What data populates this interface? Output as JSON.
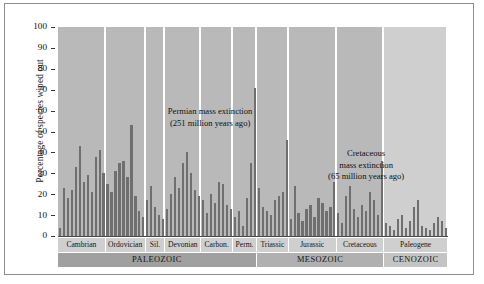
{
  "chart_data": {
    "type": "bar",
    "title": "",
    "xlabel": "",
    "ylabel": "Percentage of species wiped out",
    "ylim": [
      0,
      100
    ],
    "ytick_labels": [
      "100",
      "90",
      "80",
      "70",
      "60",
      "50",
      "40",
      "30",
      "20",
      "10",
      "0"
    ],
    "ytick_values": [
      100,
      90,
      80,
      70,
      60,
      50,
      40,
      30,
      20,
      10,
      0
    ],
    "grid": false,
    "legend": "none",
    "annotations": [
      {
        "name": "permian-annotation",
        "lines": [
          "Permian mass extinction",
          "(251 million years ago)"
        ],
        "x_pct": 39,
        "y_pct": 62
      },
      {
        "name": "cretaceous-annotation",
        "lines": [
          "Cretaceous",
          "mass extinction",
          "(65 million years ago)"
        ],
        "x_pct": 79,
        "y_pct": 42
      }
    ],
    "periods": [
      {
        "label": "Cambrian",
        "era": "PALEOZOIC",
        "start": 0,
        "count": 12
      },
      {
        "label": "Ordovician",
        "era": "PALEOZOIC",
        "start": 12,
        "count": 10
      },
      {
        "label": "Sil.",
        "era": "PALEOZOIC",
        "start": 22,
        "count": 5
      },
      {
        "label": "Devonian",
        "era": "PALEOZOIC",
        "start": 27,
        "count": 9
      },
      {
        "label": "Carbon.",
        "era": "PALEOZOIC",
        "start": 36,
        "count": 8
      },
      {
        "label": "Perm.",
        "era": "PALEOZOIC",
        "start": 44,
        "count": 6
      },
      {
        "label": "Triassic",
        "era": "MESOZOIC",
        "start": 50,
        "count": 8
      },
      {
        "label": "Jurassic",
        "era": "MESOZOIC",
        "start": 58,
        "count": 12
      },
      {
        "label": "Cretaceous",
        "era": "MESOZOIC",
        "start": 70,
        "count": 12
      },
      {
        "label": "Paleogene",
        "era": "CENOZOIC",
        "start": 82,
        "count": 16
      }
    ],
    "eras": [
      {
        "label": "PALEOZOIC",
        "start": 0,
        "count": 50,
        "shade": "dark"
      },
      {
        "label": "MESOZOIC",
        "start": 50,
        "count": 32,
        "shade": "mid"
      },
      {
        "label": "CENOZOIC",
        "start": 82,
        "count": 16,
        "shade": "lite"
      }
    ],
    "values": [
      4,
      23,
      18,
      22,
      33,
      43,
      26,
      29,
      21,
      38,
      41,
      30,
      25,
      21,
      31,
      35,
      36,
      28,
      53,
      19,
      12,
      9,
      17,
      24,
      14,
      10,
      8,
      13,
      20,
      28,
      23,
      35,
      40,
      30,
      22,
      19,
      17,
      11,
      20,
      16,
      26,
      25,
      15,
      13,
      9,
      12,
      5,
      18,
      35,
      71,
      23,
      14,
      12,
      10,
      17,
      19,
      21,
      46,
      8,
      24,
      11,
      7,
      13,
      15,
      9,
      18,
      16,
      12,
      14,
      26,
      11,
      6,
      19,
      24,
      13,
      9,
      15,
      12,
      21,
      17,
      10,
      36,
      6,
      5,
      3,
      8,
      10,
      4,
      7,
      14,
      17,
      5,
      4,
      3,
      6,
      9,
      7,
      4
    ],
    "colors": {
      "bar": "#6f6f6f",
      "panel": "#b9b9b9",
      "panel_light": "#cfcfcf",
      "era_paleozoic": "#a0a0a0",
      "era_mesozoic": "#b0b0b0",
      "era_cenozoic": "#c4c4c4",
      "text": "#111111",
      "frame": "#8d8d8d"
    }
  }
}
